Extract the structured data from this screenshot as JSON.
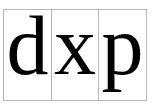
{
  "glyphs": [
    {
      "char": "d"
    },
    {
      "char": "x"
    },
    {
      "char": "p"
    }
  ],
  "colors": {
    "text": "#000000",
    "border": "#b8b8b8",
    "background": "#ffffff"
  }
}
